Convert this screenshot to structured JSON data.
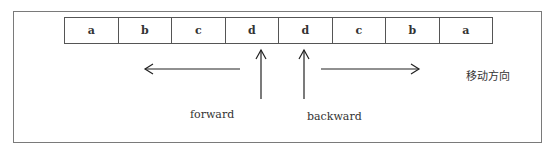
{
  "diagram": {
    "cells": [
      {
        "label": "a"
      },
      {
        "label": "b"
      },
      {
        "label": "c"
      },
      {
        "label": "d"
      },
      {
        "label": "d"
      },
      {
        "label": "c"
      },
      {
        "label": "b"
      },
      {
        "label": "a"
      }
    ],
    "labels": {
      "forward": "forward",
      "backward": "backward",
      "direction": "移动方向"
    },
    "arrows": [
      {
        "name": "forward-pointer",
        "direction": "up",
        "points_to_cell": 3
      },
      {
        "name": "backward-pointer",
        "direction": "up",
        "points_to_cell": 4
      },
      {
        "name": "move-left",
        "direction": "left"
      },
      {
        "name": "move-right",
        "direction": "right"
      }
    ]
  }
}
